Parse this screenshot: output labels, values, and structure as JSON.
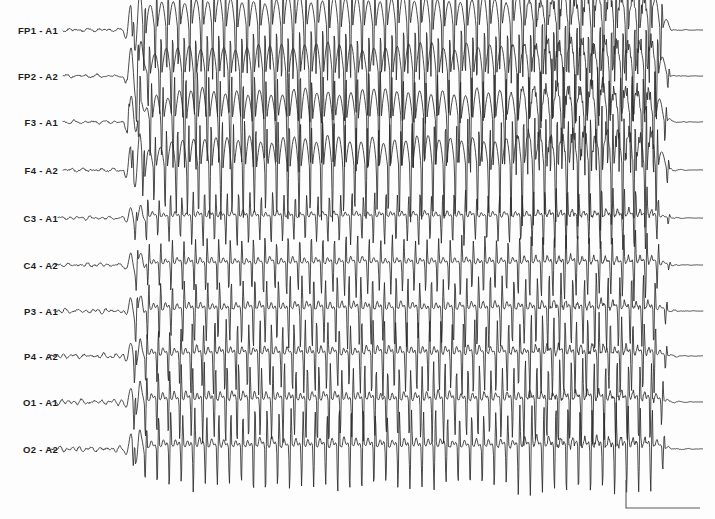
{
  "chart_data": {
    "type": "line",
    "title": "",
    "subtitle": "",
    "xlabel": "",
    "ylabel": "",
    "grid": false,
    "legend_position": "left",
    "axis_ranges": {
      "x": [
        0,
        715
      ],
      "y": [
        0,
        519
      ]
    },
    "montage": "referential (ear reference A1/A2)",
    "plot_area": {
      "left": 63,
      "right": 703,
      "top": 8,
      "bottom": 470
    },
    "channels": [
      {
        "label": "FP1 - A1",
        "baseline_y": 30,
        "amplitude": 1.0,
        "trace_start_x": 63,
        "region": "frontopolar-left"
      },
      {
        "label": "FP2 - A2",
        "baseline_y": 76,
        "amplitude": 0.97,
        "trace_start_x": 63,
        "region": "frontopolar-right"
      },
      {
        "label": "F3 - A1",
        "baseline_y": 122,
        "amplitude": 1.0,
        "trace_start_x": 63,
        "region": "frontal-left"
      },
      {
        "label": "F4 - A2",
        "baseline_y": 170,
        "amplitude": 1.02,
        "trace_start_x": 63,
        "region": "frontal-right"
      },
      {
        "label": "C3 - A1",
        "baseline_y": 218,
        "amplitude": 0.38,
        "trace_start_x": 58,
        "region": "central-left"
      },
      {
        "label": "C4 - A2",
        "baseline_y": 265,
        "amplitude": 0.42,
        "trace_start_x": 52,
        "region": "central-right"
      },
      {
        "label": "P3 - A1",
        "baseline_y": 311,
        "amplitude": 0.5,
        "trace_start_x": 55,
        "region": "parietal-left"
      },
      {
        "label": "P4 - A2",
        "baseline_y": 356,
        "amplitude": 0.52,
        "trace_start_x": 48,
        "region": "parietal-right"
      },
      {
        "label": "O1 - A1",
        "baseline_y": 402,
        "amplitude": 0.56,
        "trace_start_x": 52,
        "region": "occipital-left"
      },
      {
        "label": "O2 - A2",
        "baseline_y": 449,
        "amplitude": 0.58,
        "trace_start_x": 48,
        "region": "occipital-right"
      }
    ],
    "events": [
      {
        "name": "preictal-baseline",
        "x_start": 48,
        "x_end": 125,
        "note": "low-amplitude background activity"
      },
      {
        "name": "seizure-onset",
        "x_start": 125,
        "x_end": 138,
        "note": "abrupt high-voltage polyspike burst"
      },
      {
        "name": "rhythmic-spike-and-wave",
        "x_start": 138,
        "x_end": 500,
        "note": "approximately 3 Hz generalized spike-and-wave complexes"
      },
      {
        "name": "polyspike-bursts",
        "x_start": 500,
        "x_end": 655,
        "note": "thickened trace from fast polyspike activity riding on slow waves"
      },
      {
        "name": "seizure-offset",
        "x_start": 655,
        "x_end": 672,
        "note": "abrupt termination"
      },
      {
        "name": "postictal-attenuation",
        "x_start": 672,
        "x_end": 703,
        "note": "flattened suppressed background"
      }
    ],
    "spike_wave_frequency_hz": 3.0,
    "calibration_bar": {
      "x": 626,
      "y_top": 480,
      "y_bottom": 508,
      "x_right": 700,
      "vertical_label": "",
      "horizontal_label": "",
      "note": "unlabeled amplitude/time calibration marker"
    },
    "colors": {
      "background": "#fdfdfd",
      "trace": "#2a2a2a",
      "label_text": "#1c1c1c",
      "calibration_bar": "#5a5a5a"
    }
  },
  "labels": {
    "label_right_edge_x": 58
  }
}
